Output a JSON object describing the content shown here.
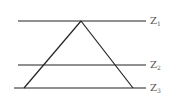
{
  "diagram": {
    "levels": [
      {
        "label": "Z",
        "sub": "1",
        "y": 21,
        "x1": 18,
        "x2": 146
      },
      {
        "label": "Z",
        "sub": "2",
        "y": 65,
        "x1": 18,
        "x2": 146
      },
      {
        "label": "Z",
        "sub": "3",
        "y": 88,
        "x1": 14,
        "x2": 146
      }
    ],
    "triangle": {
      "apex": [
        81,
        21
      ],
      "left": [
        24,
        88
      ],
      "right": [
        133,
        88
      ]
    },
    "line_color": "#222222"
  }
}
